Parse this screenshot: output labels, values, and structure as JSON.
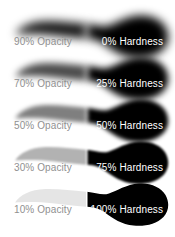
{
  "figure": {
    "background_color": "#ffffff",
    "stroke_color": "#000000",
    "opacity_label_color": "#909090",
    "hardness_label_color": "#ffffff",
    "rows": [
      {
        "opacity_label": "90% Opacity",
        "hardness_label": "0% Hardness",
        "opacity_percent": 90,
        "hardness_percent": 0,
        "fill_opacity": 0.9,
        "edge_blur": 5
      },
      {
        "opacity_label": "70% Opacity",
        "hardness_label": "25% Hardness",
        "opacity_percent": 70,
        "hardness_percent": 25,
        "fill_opacity": 0.7,
        "edge_blur": 3.5
      },
      {
        "opacity_label": "50% Opacity",
        "hardness_label": "50% Hardness",
        "opacity_percent": 50,
        "hardness_percent": 50,
        "fill_opacity": 0.5,
        "edge_blur": 2.2
      },
      {
        "opacity_label": "30% Opacity",
        "hardness_label": "75% Hardness",
        "opacity_percent": 30,
        "hardness_percent": 75,
        "fill_opacity": 0.3,
        "edge_blur": 1.2
      },
      {
        "opacity_label": "10% Opacity",
        "hardness_label": "100% Hardness",
        "opacity_percent": 10,
        "hardness_percent": 100,
        "fill_opacity": 0.1,
        "edge_blur": 0.18
      }
    ]
  }
}
